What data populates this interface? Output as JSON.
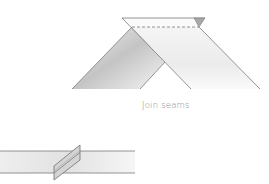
{
  "diagram": {
    "caption": "Join seams",
    "colors": {
      "stroke": "#7a7a7a",
      "shade_dark": "#bdbdbd",
      "shade_light": "#ececec",
      "caption": "#8a8a8a",
      "background": "#ffffff"
    },
    "figures": [
      {
        "name": "top-join-diagram",
        "description": "Two fabric strips joined at a right angle forming an inverted V, with dashed seam line across the top and a small folded corner triangle"
      },
      {
        "name": "bottom-strip-diagram",
        "description": "Horizontal strip with a diagonal joined seam pressed open"
      }
    ]
  }
}
